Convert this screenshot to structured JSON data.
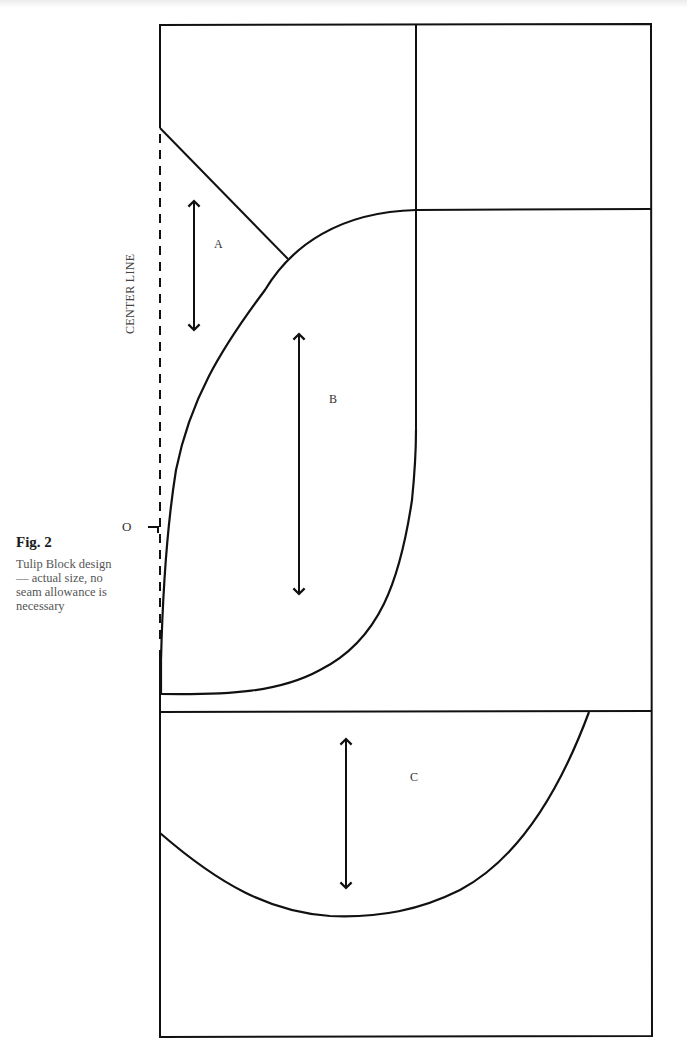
{
  "figure": {
    "number_label": "Fig. 2",
    "caption": "Tulip Block design — actual size, no seam allowance is necessary",
    "center_line_label": "CENTER LINE",
    "origin_marker_label": "O"
  },
  "pieces": [
    {
      "id": "A",
      "label": "A",
      "grain_arrow": "vertical"
    },
    {
      "id": "B",
      "label": "B",
      "grain_arrow": "vertical"
    },
    {
      "id": "C",
      "label": "C",
      "grain_arrow": "vertical"
    }
  ],
  "colors": {
    "line": "#111111",
    "background": "#ffffff",
    "text": "#333333"
  }
}
